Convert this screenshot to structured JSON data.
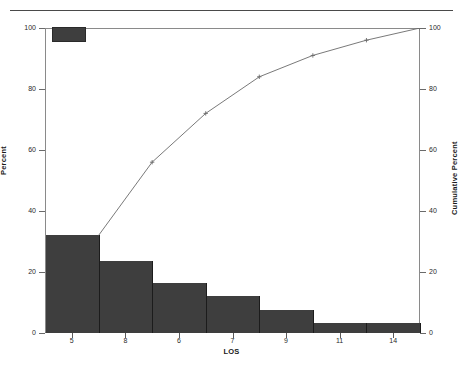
{
  "chart_data": {
    "type": "bar",
    "title": "",
    "subtitle": "",
    "xlabel": "LOS",
    "ylabel": "Percent",
    "y2label": "Cumulative Percent",
    "categories": [
      "5",
      "8",
      "6",
      "7",
      "9",
      "11",
      "14"
    ],
    "values": [
      32.0,
      23.5,
      16.3,
      12.3,
      7.5,
      3.2,
      3.2
    ],
    "series": [
      {
        "name": "Percent",
        "type": "bar",
        "axis": "left",
        "values": [
          32.0,
          23.5,
          16.3,
          12.3,
          7.5,
          3.2,
          3.2
        ]
      },
      {
        "name": "Cumulative Percent",
        "type": "line",
        "axis": "right",
        "marker": "plus",
        "values": [
          32.0,
          56.0,
          72.0,
          84.0,
          91.0,
          96.0,
          100.0
        ]
      }
    ],
    "ylim": [
      0,
      100
    ],
    "y2lim": [
      0,
      100
    ],
    "yticks": [
      0,
      20,
      40,
      60,
      80,
      100
    ],
    "y2ticks": [
      0,
      20,
      40,
      60,
      80,
      100
    ],
    "ytick_labels": [
      "0",
      "20",
      "40",
      "60",
      "80",
      "100"
    ],
    "y2tick_labels": [
      "0",
      "20",
      "40",
      "60",
      "80",
      "100"
    ],
    "xtick_labels": [
      "5",
      "8",
      "6",
      "7",
      "9",
      "11",
      "14"
    ],
    "grid": false,
    "legend": {
      "position": "top-left",
      "entries": [
        {
          "label": "",
          "color": "#3e3e3e",
          "swatch": "filled-rect"
        }
      ]
    },
    "colors": {
      "bar_fill": "#3e3e3e",
      "bar_edge": "#1c1c1c",
      "line": "#6a6a6a",
      "frame": "#8a8a8a",
      "axis_text": "#2a2a2a",
      "title_text": "#1a1a1a",
      "background": "#ffffff",
      "page_rule": "#4a4a4a"
    },
    "annotations": []
  },
  "figure": {
    "page_rule_name": "page-separator",
    "axis_left_title": "Percent",
    "axis_right_title": "Cumulative Percent",
    "axis_x_title": "LOS"
  }
}
